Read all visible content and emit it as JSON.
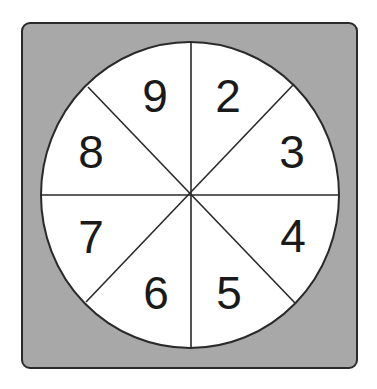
{
  "diagram": {
    "type": "spinner",
    "sections": 8,
    "colors": {
      "background": "#ffffff",
      "board_fill": "#a8a8a8",
      "board_border": "#2a2a2a",
      "wheel_fill": "#ffffff",
      "lines": "#2a2a2a",
      "text": "#1a1a1a"
    },
    "labels": [
      {
        "value": "2",
        "position": "top-right"
      },
      {
        "value": "3",
        "position": "right-upper"
      },
      {
        "value": "4",
        "position": "right-lower"
      },
      {
        "value": "5",
        "position": "bottom-right"
      },
      {
        "value": "6",
        "position": "bottom-left"
      },
      {
        "value": "7",
        "position": "left-lower"
      },
      {
        "value": "8",
        "position": "left-upper"
      },
      {
        "value": "9",
        "position": "top-left"
      }
    ]
  }
}
